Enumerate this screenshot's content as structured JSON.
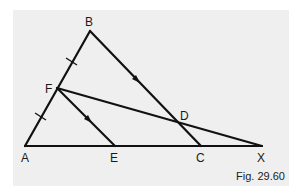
{
  "figure": {
    "caption": "Fig. 29.60",
    "background_color": "#efefef",
    "line_color": "#111111"
  },
  "points": {
    "A": {
      "label": "A",
      "x": 25,
      "y": 146
    },
    "B": {
      "label": "B",
      "x": 90,
      "y": 31
    },
    "C": {
      "label": "C",
      "x": 201,
      "y": 146
    },
    "D": {
      "label": "D",
      "x": 183,
      "y": 124
    },
    "E": {
      "label": "E",
      "x": 115,
      "y": 146
    },
    "F": {
      "label": "F",
      "x": 57,
      "y": 88
    },
    "X": {
      "label": "X",
      "x": 262,
      "y": 146
    }
  },
  "segments": [
    {
      "from": "A",
      "to": "B"
    },
    {
      "from": "B",
      "to": "C",
      "arrow": true
    },
    {
      "from": "A",
      "to": "X"
    },
    {
      "from": "F",
      "to": "E",
      "arrow": true
    },
    {
      "from": "F",
      "to": "X"
    }
  ],
  "annotations": {
    "equal_ticks": [
      "BF",
      "FA"
    ],
    "parallel_arrows": [
      "BC",
      "FE"
    ]
  }
}
